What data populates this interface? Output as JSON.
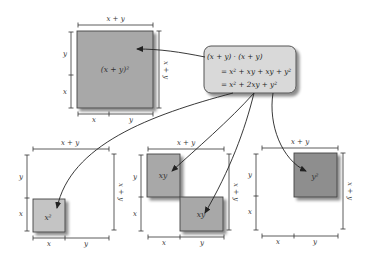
{
  "diagram": {
    "equation_box": {
      "line1": "(x + y) · (x + y)",
      "line2": "= x² + xy + xy + y²",
      "line3": "= x² + 2xy + y²"
    },
    "top_square": {
      "area_label": "(x + y)²",
      "top_dim": "x + y",
      "right_dim": "x + y",
      "left_dims": [
        "y",
        "x"
      ],
      "bottom_dims": [
        "x",
        "y"
      ],
      "fill": "#a8a8a8"
    },
    "panels": [
      {
        "name": "x-squared",
        "area_label": "x²",
        "top_dim": "x + y",
        "right_dim": "x + y",
        "left_dims": [
          "y",
          "x"
        ],
        "bottom_dims": [
          "x",
          "y"
        ],
        "fill": "#c4c4c4"
      },
      {
        "name": "two-xy",
        "area_labels": [
          "xy",
          "xy"
        ],
        "top_dim": "x + y",
        "right_dim": "x + y",
        "left_dims": [
          "y",
          "x"
        ],
        "bottom_dims": [
          "x",
          "y"
        ],
        "fill": "#a8a8a8"
      },
      {
        "name": "y-squared",
        "area_label": "y²",
        "top_dim": "x + y",
        "right_dim": "x + y",
        "left_dims": [
          "y",
          "x"
        ],
        "bottom_dims": [
          "x",
          "y"
        ],
        "fill": "#8e8e8e"
      }
    ],
    "colors": {
      "box_fill": "#d9d9d9",
      "box_stroke": "#555555",
      "line": "#333333"
    }
  }
}
